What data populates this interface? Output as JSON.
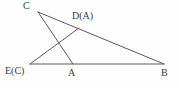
{
  "figure": {
    "background_color": "#fefefe",
    "stroke_color": "#5a5a5a",
    "label_color": "#3c3c3c",
    "width": 179,
    "height": 88
  },
  "points": {
    "C": {
      "label": "C",
      "x": 38,
      "y": 12
    },
    "D": {
      "label": "D(A)",
      "x": 79,
      "y": 28
    },
    "E": {
      "label": "E(C)",
      "x": 30,
      "y": 64
    },
    "A": {
      "label": "A",
      "x": 73,
      "y": 64
    },
    "B": {
      "label": "B",
      "x": 164,
      "y": 64
    }
  },
  "segments": [
    {
      "name": "C-to-B",
      "from": "C",
      "to": "B",
      "path": "M 38 12 L 164 64"
    },
    {
      "name": "C-to-A",
      "from": "C",
      "to": "A",
      "path": "M 38 12 L 73 64"
    },
    {
      "name": "E-to-D",
      "from": "E",
      "to": "D",
      "path": "M 30 64 L 79 28"
    },
    {
      "name": "E-to-B",
      "from": "E",
      "to": "B",
      "path": "M 30 64 L 164 64"
    }
  ],
  "labels": {
    "C": "C",
    "DA": "D(A)",
    "EC": "E(C)",
    "A": "A",
    "B": "B"
  }
}
